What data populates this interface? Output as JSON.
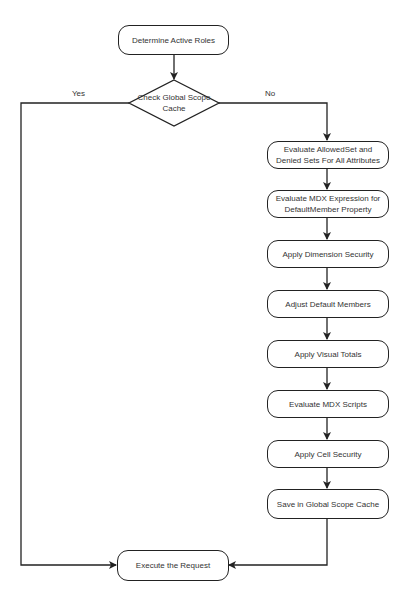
{
  "diagram": {
    "start": {
      "label": "Determine Active Roles"
    },
    "decision": {
      "label": "Check Global Scope Cache"
    },
    "branches": {
      "yes": "Yes",
      "no": "No"
    },
    "steps": [
      {
        "label": "Evaluate AllowedSet and Denied Sets For All Attributes"
      },
      {
        "label": "Evaluate MDX Expression for DefaultMember Property"
      },
      {
        "label": "Apply Dimension Security"
      },
      {
        "label": "Adjust Default Members"
      },
      {
        "label": "Apply Visual Totals"
      },
      {
        "label": "Evaluate MDX Scripts"
      },
      {
        "label": "Apply Cell Security"
      },
      {
        "label": "Save in Global Scope Cache"
      }
    ],
    "end": {
      "label": "Execute the Request"
    },
    "colors": {
      "stroke": "#222222",
      "text": "#333333",
      "background": "#ffffff"
    }
  }
}
